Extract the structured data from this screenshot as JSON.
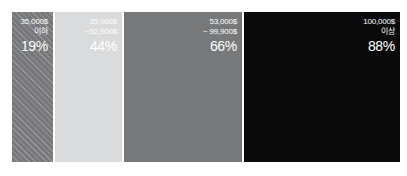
{
  "chart_data": {
    "type": "bar",
    "title": "",
    "subtitle": "",
    "xlabel": "",
    "ylabel": "",
    "orientation": "horizontal-stacked",
    "legend": "none",
    "grid": false,
    "categories": [
      "35,000$ 이하",
      "35,000$ ~52,900$",
      "53,000$ ~ 99,900$",
      "100,000$ 이상"
    ],
    "values": [
      19,
      44,
      66,
      88
    ],
    "value_unit": "%",
    "widths_px": [
      41,
      67,
      118,
      156
    ],
    "colors": [
      "#77787a",
      "#d9dbdc",
      "#77787a",
      "#0a0a0a"
    ],
    "segments": [
      {
        "line1": "35,000$",
        "line2": "이하",
        "percent": "19%",
        "value": 19,
        "color": "#77787a",
        "pattern": "diagonal-hatch",
        "text_color": "#ffffff"
      },
      {
        "line1": "35,000$",
        "line2": "~52,900$",
        "percent": "44%",
        "value": 44,
        "color": "#d9dbdc",
        "pattern": "none",
        "text_color": "#ffffff"
      },
      {
        "line1": "53,000$",
        "line2": "~ 99,900$",
        "percent": "66%",
        "value": 66,
        "color": "#77787a",
        "pattern": "none",
        "text_color": "#ffffff"
      },
      {
        "line1": "100,000$",
        "line2": "이상",
        "percent": "88%",
        "value": 88,
        "color": "#0a0a0a",
        "pattern": "none",
        "text_color": "#ffffff"
      }
    ]
  },
  "background": "#ffffff"
}
